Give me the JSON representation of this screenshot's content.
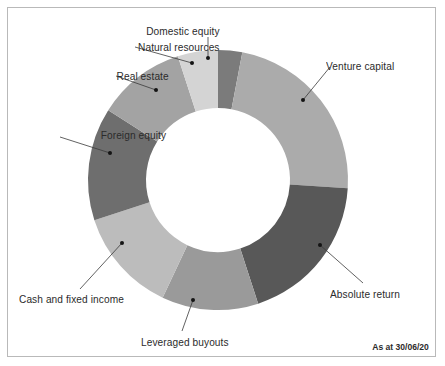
{
  "figure": {
    "background_color": "#ffffff",
    "border_color": "#b9b9b9",
    "text_color": "#2b2b2b",
    "date_note": "As at 30/06/20"
  },
  "chart_data": {
    "type": "pie",
    "variant": "donut",
    "title": "",
    "subtitle": "",
    "xlabel": "",
    "ylabel": "",
    "legend_position": "none",
    "labels_position": "callout",
    "grid": false,
    "center_x": 218,
    "center_y": 180,
    "outer_radius": 130,
    "inner_radius": 72,
    "start_angle_deg": 0,
    "direction": "clockwise",
    "units": "percent",
    "total": 100,
    "categories": [
      "Domestic equity",
      "Venture capital",
      "Absolute return",
      "Leveraged buyouts",
      "Cash and fixed income",
      "Foreign equity",
      "Real estate",
      "Natural resources"
    ],
    "values": [
      3,
      23,
      19,
      12,
      13,
      14,
      11,
      5
    ],
    "colors": [
      "#7b7b7b",
      "#ababab",
      "#585858",
      "#9a9a9a",
      "#bcbcbc",
      "#6e6e6e",
      "#a3a3a3",
      "#d4d4d4"
    ],
    "slices": [
      {
        "label": "Domestic equity",
        "value": 3,
        "color": "#7b7b7b",
        "start_deg": 0,
        "end_deg": 10.8
      },
      {
        "label": "Venture capital",
        "value": 23,
        "color": "#ababab",
        "start_deg": 10.8,
        "end_deg": 93.6
      },
      {
        "label": "Absolute return",
        "value": 19,
        "color": "#585858",
        "start_deg": 93.6,
        "end_deg": 162.0
      },
      {
        "label": "Leveraged buyouts",
        "value": 12,
        "color": "#9a9a9a",
        "start_deg": 162.0,
        "end_deg": 205.2
      },
      {
        "label": "Cash and fixed income",
        "value": 13,
        "color": "#bcbcbc",
        "start_deg": 205.2,
        "end_deg": 252.0
      },
      {
        "label": "Foreign equity",
        "value": 14,
        "color": "#6e6e6e",
        "start_deg": 252.0,
        "end_deg": 302.4
      },
      {
        "label": "Real estate",
        "value": 11,
        "color": "#a3a3a3",
        "start_deg": 302.4,
        "end_deg": 342.0
      },
      {
        "label": "Natural resources",
        "value": 5,
        "color": "#d4d4d4",
        "start_deg": 342.0,
        "end_deg": 360.0
      }
    ]
  },
  "callouts": [
    {
      "id": "domestic-equity",
      "label": "Domestic equity",
      "text_x": 143,
      "text_y": 25,
      "align": "center",
      "line": [
        [
          208,
          37
        ],
        [
          208,
          58
        ]
      ],
      "dot": [
        208,
        58
      ]
    },
    {
      "id": "natural-resources",
      "label": "Natural resources",
      "text_x": 131,
      "text_y": 41,
      "align": "right",
      "line": [
        [
          135,
          47
        ],
        [
          192,
          63
        ]
      ],
      "dot": [
        192,
        63
      ]
    },
    {
      "id": "real-estate",
      "label": "Real estate",
      "text_x": 112,
      "text_y": 70,
      "align": "right",
      "line": [
        [
          116,
          76
        ],
        [
          156,
          90
        ]
      ],
      "dot": [
        156,
        90
      ]
    },
    {
      "id": "foreign-equity",
      "label": "Foreign equity",
      "text_x": 95,
      "text_y": 129,
      "align": "right",
      "line": [
        [
          60,
          137
        ],
        [
          110,
          153
        ]
      ],
      "dot": [
        110,
        153
      ]
    },
    {
      "id": "cash-and-fixed-income",
      "label": "Cash and fixed income",
      "text_x": 19,
      "text_y": 293,
      "align": "left",
      "line": [
        [
          80,
          289
        ],
        [
          122,
          243
        ]
      ],
      "dot": [
        122,
        243
      ]
    },
    {
      "id": "leveraged-buyouts",
      "label": "Leveraged buyouts",
      "text_x": 141,
      "text_y": 336,
      "align": "left",
      "line": [
        [
          182,
          331
        ],
        [
          193,
          300
        ]
      ],
      "dot": [
        193,
        300
      ]
    },
    {
      "id": "absolute-return",
      "label": "Absolute return",
      "text_x": 330,
      "text_y": 288,
      "align": "left",
      "line": [
        [
          363,
          283
        ],
        [
          320,
          245
        ]
      ],
      "dot": [
        320,
        245
      ]
    },
    {
      "id": "venture-capital",
      "label": "Venture capital",
      "text_x": 326,
      "text_y": 60,
      "align": "left",
      "line": [
        [
          330,
          67
        ],
        [
          303,
          100
        ]
      ],
      "dot": [
        303,
        100
      ]
    }
  ]
}
